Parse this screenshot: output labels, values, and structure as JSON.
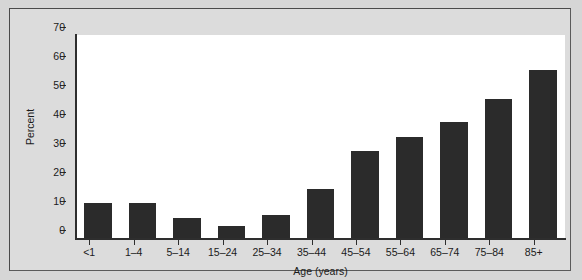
{
  "chart_data": {
    "type": "bar",
    "title": "",
    "xlabel": "Age (years)",
    "ylabel": "Percent",
    "categories": [
      "<1",
      "1–4",
      "5–14",
      "15–24",
      "25–34",
      "35–44",
      "45–54",
      "55–64",
      "65–74",
      "75–84",
      "85+"
    ],
    "values": [
      12,
      12,
      7,
      4,
      8,
      17,
      30,
      35,
      40,
      48,
      58
    ],
    "ylim": [
      0,
      70
    ],
    "yticks": [
      0,
      10,
      20,
      30,
      40,
      50,
      60,
      70
    ],
    "ytick_labels": [
      "0",
      "10",
      "20",
      "30",
      "40",
      "50",
      "60",
      "70"
    ],
    "grid": false,
    "legend": null,
    "bar_color": "#2b2b2b",
    "plot_background": "#ffffff",
    "figure_background": "#d6d6d6",
    "axis_color": "#2e2e2e"
  }
}
